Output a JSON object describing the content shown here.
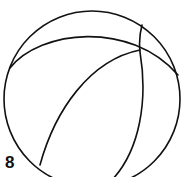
{
  "figure": {
    "label": "8",
    "stroke_color": "#111111",
    "background": "#ffffff"
  }
}
